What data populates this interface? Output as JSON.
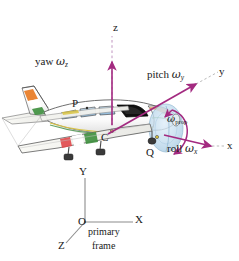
{
  "figure": {
    "colors": {
      "axis_arrow": "#a32a80",
      "axis_dash": "#b07ab0",
      "primary_frame_line": "#8c8c8c",
      "label_text": "#1a1a1a",
      "fuselage": "#fdfdfd",
      "fuselage_outline": "#3c3c3c",
      "window_glass": "#a8cbe6",
      "windshield_dark": "#101010",
      "prop_disc": "#bcd9ee",
      "stripe_orange": "#e87b24",
      "stripe_green": "#3d8f3d",
      "stripe_red": "#e0484a",
      "stripe_yellow": "#d8c23a",
      "wing_top": "#f4f4f0",
      "shadow_gray": "#c9c9c9"
    }
  },
  "body_axes": {
    "yaw": {
      "label_word": "yaw",
      "omega": "ω",
      "subscript": "z",
      "axis_letter": "z",
      "description": "vertical body axis, arrow pointing up"
    },
    "pitch": {
      "label_word": "pitch",
      "omega": "ω",
      "subscript": "y",
      "axis_letter": "y",
      "description": "lateral body axis, arrow pointing upper right"
    },
    "roll": {
      "label_word": "roll",
      "omega": "ω",
      "subscript": "x",
      "axis_letter": "x",
      "description": "longitudinal body axis, arrow pointing right"
    },
    "propeller": {
      "omega": "ω",
      "subscript": "prop",
      "description": "curved arrow around propeller disc"
    }
  },
  "points": {
    "p": "P",
    "c": "C",
    "q": "Q"
  },
  "primary_frame": {
    "origin": "O",
    "x_axis": "X",
    "y_axis": "Y",
    "z_axis": "Z",
    "caption_line1": "primary",
    "caption_line2": "frame"
  }
}
